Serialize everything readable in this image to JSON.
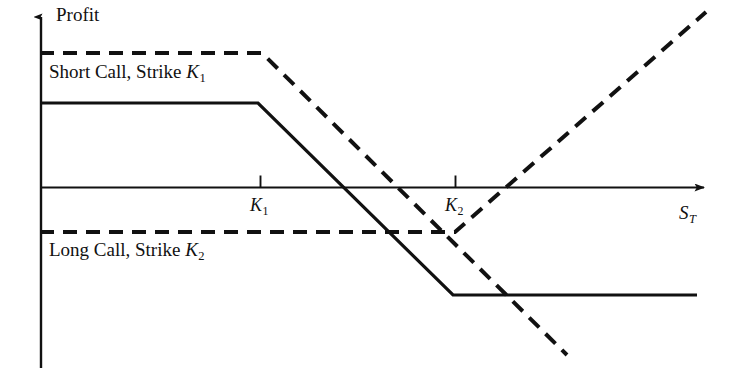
{
  "figure": {
    "background_color": "#ffffff",
    "line_color": "#111111",
    "width": 738,
    "height": 378
  },
  "axes": {
    "y_label": "Profit",
    "x_label_base": "S",
    "x_label_sub": "T",
    "x_ticks": [
      {
        "base": "K",
        "sub": "1",
        "x": 260
      },
      {
        "base": "K",
        "sub": "2",
        "x": 455
      }
    ]
  },
  "legend": {
    "short_call": {
      "text_base": "Short Call, Strike ",
      "symbol_base": "K",
      "symbol_sub": "1",
      "style": "dashed"
    },
    "long_call": {
      "text_base": "Long Call, Strike ",
      "symbol_base": "K",
      "symbol_sub": "2",
      "style": "dashed"
    }
  },
  "chart_data": {
    "type": "line",
    "title": "",
    "xlabel": "S_T",
    "ylabel": "Profit",
    "grid": false,
    "legend_position": "inline-annotation",
    "xlim": [
      40,
      738
    ],
    "ylim": [
      378,
      0
    ],
    "zero_line_y": 187,
    "x_axis_start": 40,
    "x_axis_end": 710,
    "y_axis_top": 10,
    "y_axis_bottom": 368,
    "strikes": {
      "K1": 260,
      "K2": 455
    },
    "series": [
      {
        "name": "Short Call, Strike K1",
        "style": "dashed",
        "dash_pattern": "14,9",
        "width": 4,
        "points": [
          {
            "x": 40,
            "y": 53
          },
          {
            "x": 262,
            "y": 53
          },
          {
            "x": 567,
            "y": 355
          }
        ]
      },
      {
        "name": "Long Call, Strike K2",
        "style": "dashed",
        "dash_pattern": "14,9",
        "width": 4,
        "points": [
          {
            "x": 40,
            "y": 232
          },
          {
            "x": 455,
            "y": 232
          },
          {
            "x": 706,
            "y": 12
          }
        ]
      },
      {
        "name": "Bear Call Spread (net profit)",
        "style": "solid",
        "width": 3.2,
        "points": [
          {
            "x": 40,
            "y": 103
          },
          {
            "x": 258,
            "y": 103
          },
          {
            "x": 453,
            "y": 295
          },
          {
            "x": 697,
            "y": 295
          }
        ]
      }
    ]
  }
}
